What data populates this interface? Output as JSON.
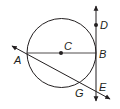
{
  "diagram": {
    "type": "geometry-circle-tangent-secant",
    "colors": {
      "stroke": "#231f20",
      "background": "#ffffff"
    },
    "points": {
      "A": {
        "label": "A"
      },
      "B": {
        "label": "B"
      },
      "C": {
        "label": "C"
      },
      "D": {
        "label": "D"
      },
      "E": {
        "label": "E"
      },
      "G": {
        "label": "G"
      }
    },
    "elements": {
      "circle": "circle centered at C",
      "segment": "diameter AB through C",
      "tangent_line": "line DE tangent to circle at B",
      "secant_line": "line through A and G meeting tangent at E"
    }
  }
}
